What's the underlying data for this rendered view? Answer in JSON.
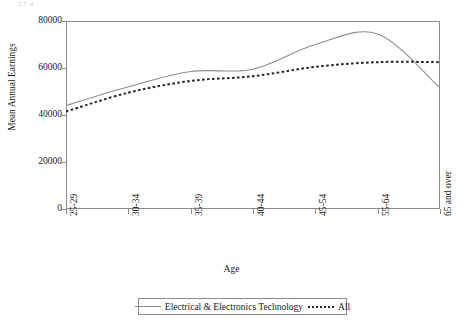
{
  "artifact": {
    "text": "27 4"
  },
  "chart_data": {
    "type": "line",
    "title": "",
    "xlabel": "Age",
    "ylabel": "Mean Annual Earnings",
    "categories": [
      "25-29",
      "30-34",
      "35-39",
      "40-44",
      "45-54",
      "55-64",
      "65 and over"
    ],
    "yticks": [
      0,
      20000,
      40000,
      60000,
      80000
    ],
    "ytick_labels": [
      "0",
      "20000",
      "40000",
      "60000",
      "80000"
    ],
    "ylim": [
      0,
      80000
    ],
    "grid": false,
    "legend_position": "bottom",
    "series": [
      {
        "name": "Electrical & Electronics Technology",
        "style": "solid",
        "color": "#8c8c8c",
        "values": [
          44000,
          52000,
          58500,
          59500,
          70000,
          74500,
          51500
        ]
      },
      {
        "name": "All",
        "style": "dotted",
        "color": "#262626",
        "values": [
          41500,
          49500,
          54500,
          56500,
          60500,
          62500,
          62500
        ]
      }
    ]
  },
  "axis": {
    "y_title": "Mean Annual Earnings",
    "x_title": "Age"
  },
  "legend": {
    "items": [
      {
        "label": "Electrical & Electronics Technology",
        "style": "solid"
      },
      {
        "label": "All",
        "style": "dotted"
      }
    ]
  },
  "colors": {
    "frame": "#8c8c8c",
    "series_solid": "#8c8c8c",
    "series_dotted": "#262626",
    "text": "#1a1a1a",
    "background": "#ffffff"
  }
}
